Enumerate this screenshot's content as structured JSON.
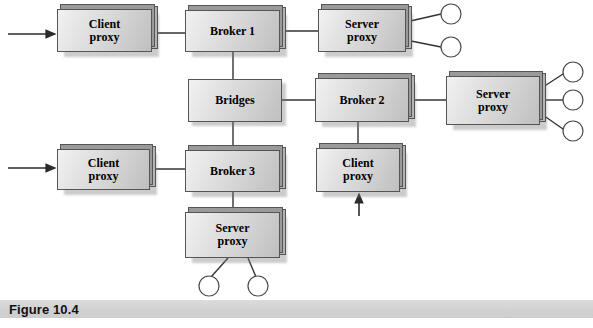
{
  "figure": {
    "caption": "Figure 10.4",
    "type": "block-diagram"
  },
  "colors": {
    "node_fill_light": "#f2f2f2",
    "node_fill_dark": "#bfbfbf",
    "node_border": "#555555",
    "plate_fill": "#9a9a9a",
    "line": "#333333",
    "caption_bar": "#d4d4d4",
    "page_background": "#ffffff"
  },
  "nodes": [
    {
      "id": "client_proxy_top",
      "line1": "Client",
      "line2": "proxy",
      "x": 57,
      "y": 9,
      "w": 95,
      "h": 43,
      "font": 12,
      "stacked": true
    },
    {
      "id": "broker_1",
      "line1": "Broker 1",
      "line2": "",
      "x": 185,
      "y": 10,
      "w": 95,
      "h": 42,
      "font": 12,
      "stacked": true
    },
    {
      "id": "server_proxy_top",
      "line1": "Server",
      "line2": "proxy",
      "x": 318,
      "y": 9,
      "w": 88,
      "h": 43,
      "font": 12,
      "stacked": true
    },
    {
      "id": "bridges",
      "line1": "Bridges",
      "line2": "",
      "x": 188,
      "y": 79,
      "w": 94,
      "h": 43,
      "font": 12,
      "stacked": false
    },
    {
      "id": "broker_2",
      "line1": "Broker 2",
      "line2": "",
      "x": 315,
      "y": 78,
      "w": 94,
      "h": 44,
      "font": 12,
      "stacked": true
    },
    {
      "id": "server_proxy_right",
      "line1": "Server",
      "line2": "proxy",
      "x": 446,
      "y": 76,
      "w": 94,
      "h": 49,
      "font": 12,
      "stacked": true
    },
    {
      "id": "client_proxy_bottom",
      "line1": "Client",
      "line2": "proxy",
      "x": 57,
      "y": 149,
      "w": 93,
      "h": 41,
      "font": 12,
      "stacked": true
    },
    {
      "id": "broker_3",
      "line1": "Broker 3",
      "line2": "",
      "x": 185,
      "y": 150,
      "w": 95,
      "h": 42,
      "font": 12,
      "stacked": true
    },
    {
      "id": "client_proxy_mid",
      "line1": "Client",
      "line2": "proxy",
      "x": 316,
      "y": 148,
      "w": 84,
      "h": 44,
      "font": 12,
      "stacked": true
    },
    {
      "id": "server_proxy_bottom",
      "line1": "Server",
      "line2": "proxy",
      "x": 185,
      "y": 212,
      "w": 95,
      "h": 46,
      "font": 12,
      "stacked": true
    }
  ],
  "endpoint_circles": [
    {
      "id": "obj_top_1",
      "cx": 451,
      "cy": 14,
      "r": 10
    },
    {
      "id": "obj_top_2",
      "cx": 451,
      "cy": 47,
      "r": 10
    },
    {
      "id": "obj_right_1",
      "cx": 573,
      "cy": 72,
      "r": 10
    },
    {
      "id": "obj_right_2",
      "cx": 573,
      "cy": 100,
      "r": 10
    },
    {
      "id": "obj_right_3",
      "cx": 573,
      "cy": 131,
      "r": 10
    },
    {
      "id": "obj_bottom_1",
      "cx": 209,
      "cy": 286,
      "r": 10
    },
    {
      "id": "obj_bottom_2",
      "cx": 258,
      "cy": 286,
      "r": 10
    }
  ],
  "connectors": [
    {
      "id": "client_proxy_top-to-broker_1",
      "from": "client_proxy_top",
      "to": "broker_1",
      "kind": "line",
      "points": "152,33 185,33"
    },
    {
      "id": "broker_1-to-server_proxy_top",
      "from": "broker_1",
      "to": "server_proxy_top",
      "kind": "line",
      "points": "280,31 318,31"
    },
    {
      "id": "broker_1-to-bridges",
      "from": "broker_1",
      "to": "bridges",
      "kind": "line",
      "points": "233,52 233,79"
    },
    {
      "id": "bridges-to-broker_2",
      "from": "bridges",
      "to": "broker_2",
      "kind": "line",
      "points": "282,100 315,100"
    },
    {
      "id": "bridges-to-broker_3",
      "from": "bridges",
      "to": "broker_3",
      "kind": "line",
      "points": "233,122 233,150"
    },
    {
      "id": "broker_2-to-server_proxy_right",
      "from": "broker_2",
      "to": "server_proxy_right",
      "kind": "line",
      "points": "409,100 446,100"
    },
    {
      "id": "broker_2-to-client_proxy_mid",
      "from": "broker_2",
      "to": "client_proxy_mid",
      "kind": "line",
      "points": "358,122 358,148"
    },
    {
      "id": "client_proxy_bottom-to-broker_3",
      "from": "client_proxy_bottom",
      "to": "broker_3",
      "kind": "line",
      "points": "150,169 185,169"
    },
    {
      "id": "broker_3-to-server_proxy_bottom",
      "from": "broker_3",
      "to": "server_proxy_bottom",
      "kind": "line",
      "points": "233,192 233,212"
    },
    {
      "id": "server_proxy_top-to-obj_top_1",
      "from": "server_proxy_top",
      "to": "obj_top_1",
      "kind": "line",
      "points": "406,22 441,14"
    },
    {
      "id": "server_proxy_top-to-obj_top_2",
      "from": "server_proxy_top",
      "to": "obj_top_2",
      "kind": "line",
      "points": "406,40 441,47"
    },
    {
      "id": "server_proxy_right-to-obj_right_1",
      "from": "server_proxy_right",
      "to": "obj_right_1",
      "kind": "line",
      "points": "540,89 563,74"
    },
    {
      "id": "server_proxy_right-to-obj_right_2",
      "from": "server_proxy_right",
      "to": "obj_right_2",
      "kind": "line",
      "points": "540,100 563,100"
    },
    {
      "id": "server_proxy_right-to-obj_right_3",
      "from": "server_proxy_right",
      "to": "obj_right_3",
      "kind": "line",
      "points": "540,113 563,129"
    },
    {
      "id": "server_proxy_bottom-to-obj_bottom_1",
      "from": "server_proxy_bottom",
      "to": "obj_bottom_1",
      "kind": "line",
      "points": "228,258 211,277"
    },
    {
      "id": "server_proxy_bottom-to-obj_bottom_2",
      "from": "server_proxy_bottom",
      "to": "obj_bottom_2",
      "kind": "line",
      "points": "248,258 256,277"
    }
  ],
  "arrows": [
    {
      "id": "input-arrow-top",
      "points": "8,34 55,34",
      "direction": "right",
      "target": "client_proxy_top"
    },
    {
      "id": "input-arrow-bottom",
      "points": "8,168 55,168",
      "direction": "right",
      "target": "client_proxy_bottom"
    },
    {
      "id": "input-arrow-mid",
      "points": "359,216 359,194",
      "direction": "up",
      "target": "client_proxy_mid"
    }
  ]
}
